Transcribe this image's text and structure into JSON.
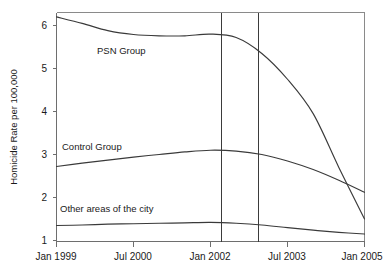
{
  "chart_data": {
    "type": "line",
    "title": "",
    "xlabel": "",
    "ylabel": "Homicide Rate per 100,000",
    "grid": false,
    "legend_position": "inline-labels",
    "x_tick_labels": [
      "Jan 1999",
      "Jul 2000",
      "Jan 2002",
      "Jul 2003",
      "Jan 2005"
    ],
    "y_tick_labels": [
      "1",
      "2",
      "3",
      "4",
      "5",
      "6"
    ],
    "ylim": [
      1,
      6.45
    ],
    "xlim": [
      "Jan 1999",
      "Jan 2005"
    ],
    "annotations": [
      {
        "name": "intervention-start",
        "type": "vertical-line",
        "x_label": "Apr 2002"
      },
      {
        "name": "intervention-end",
        "type": "vertical-line",
        "x_label": "Jan 2003"
      }
    ],
    "series": [
      {
        "name": "PSN Group",
        "label": "PSN Group",
        "x": [
          "Jan 1999",
          "Jul 1999",
          "Jan 2000",
          "Jul 2000",
          "Jan 2001",
          "Jul 2001",
          "Jan 2002",
          "Jul 2002",
          "Jan 2003",
          "Jul 2003",
          "Jan 2004",
          "Jul 2004",
          "Jan 2005"
        ],
        "values": [
          6.2,
          6.05,
          5.88,
          5.79,
          5.76,
          5.76,
          5.8,
          5.72,
          5.35,
          4.75,
          3.95,
          2.7,
          1.5
        ]
      },
      {
        "name": "Control Group",
        "label": "Control Group",
        "x": [
          "Jan 1999",
          "Jul 1999",
          "Jan 2000",
          "Jul 2000",
          "Jan 2001",
          "Jul 2001",
          "Jan 2002",
          "Jul 2002",
          "Jan 2003",
          "Jul 2003",
          "Jan 2004",
          "Jul 2004",
          "Jan 2005"
        ],
        "values": [
          2.72,
          2.8,
          2.87,
          2.94,
          3.0,
          3.06,
          3.1,
          3.08,
          3.0,
          2.85,
          2.65,
          2.4,
          2.12
        ]
      },
      {
        "name": "Other areas of the city",
        "label": "Other areas of the city",
        "x": [
          "Jan 1999",
          "Jul 1999",
          "Jan 2000",
          "Jul 2000",
          "Jan 2001",
          "Jul 2001",
          "Jan 2002",
          "Jul 2002",
          "Jan 2003",
          "Jul 2003",
          "Jan 2004",
          "Jul 2004",
          "Jan 2005"
        ],
        "values": [
          1.35,
          1.36,
          1.38,
          1.39,
          1.4,
          1.41,
          1.42,
          1.4,
          1.36,
          1.3,
          1.24,
          1.19,
          1.15
        ]
      }
    ]
  },
  "axes": {
    "y_title": "Homicide Rate per 100,000",
    "y_ticks": [
      {
        "label": "6"
      },
      {
        "label": "5"
      },
      {
        "label": "4"
      },
      {
        "label": "3"
      },
      {
        "label": "2"
      },
      {
        "label": "1"
      }
    ],
    "x_ticks": [
      {
        "label": "Jan 1999"
      },
      {
        "label": "Jul 2000"
      },
      {
        "label": "Jan 2002"
      },
      {
        "label": "Jul 2003"
      },
      {
        "label": "Jan 2005"
      }
    ]
  },
  "series_labels": {
    "psn": "PSN Group",
    "control": "Control Group",
    "other": "Other areas of the city"
  },
  "colors": {
    "line": "#3a3a3a",
    "frame": "#8a8a8a",
    "axis": "#6e6e6e",
    "ref_line": "#3b3b3b",
    "background": "#ffffff",
    "text": "#1a1a1a"
  }
}
